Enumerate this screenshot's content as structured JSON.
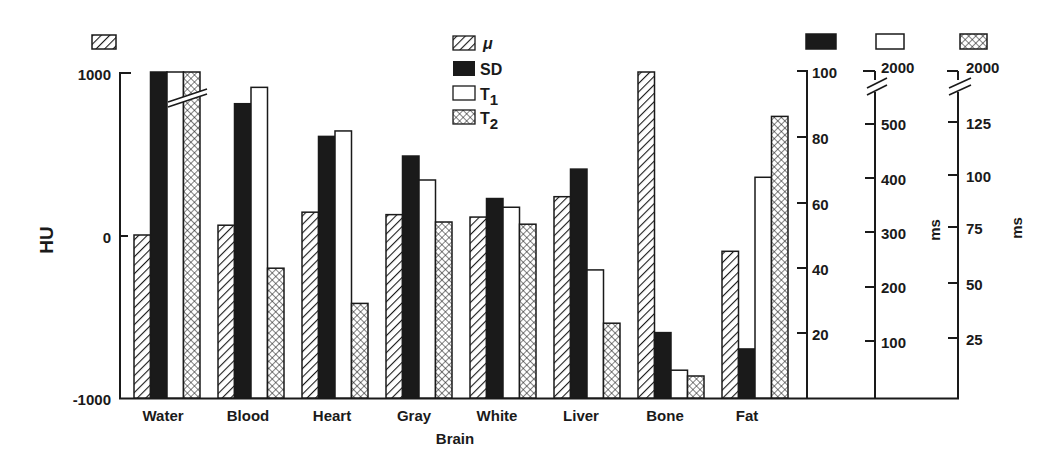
{
  "chart_data": {
    "type": "bar",
    "title": "",
    "xlabel": "",
    "categories": [
      "Water",
      "Blood",
      "Heart",
      "Gray\nBrain",
      "White",
      "Liver",
      "Bone",
      "Fat"
    ],
    "category_labels": [
      "Water",
      "Blood",
      "Heart",
      "Gray",
      "White",
      "Liver",
      "Bone",
      "Fat"
    ],
    "category_sublabel": {
      "index": 3.5,
      "text": "Brain"
    },
    "series": [
      {
        "name": "μ",
        "key": "mu",
        "pattern": "hatch",
        "axis": "HU",
        "values": [
          0,
          60,
          140,
          125,
          110,
          235,
          1000,
          -100
        ]
      },
      {
        "name": "SD",
        "key": "sd",
        "pattern": "solid-black",
        "axis": "SD",
        "values": [
          100,
          90,
          80,
          74,
          61,
          70,
          20,
          15
        ],
        "broken": [
          true,
          false,
          false,
          false,
          false,
          false,
          false,
          false
        ]
      },
      {
        "name": "T1",
        "key": "t1",
        "pattern": "white",
        "axis": "T1 ms",
        "values": [
          2000,
          570,
          490,
          400,
          350,
          235,
          51,
          405
        ],
        "broken": [
          true,
          false,
          false,
          false,
          false,
          false,
          false,
          false
        ]
      },
      {
        "name": "T2",
        "key": "t2",
        "pattern": "crosshatch",
        "axis": "T2 ms",
        "values": [
          2000,
          59,
          43,
          80,
          79,
          34,
          10,
          128
        ],
        "broken": [
          true,
          false,
          false,
          false,
          false,
          false,
          false,
          false
        ]
      }
    ],
    "axes": [
      {
        "id": "HU",
        "position": "left",
        "label": "HU",
        "range": [
          -1000,
          1000
        ],
        "ticks": [
          "1000",
          "0",
          "-1000"
        ],
        "legend_swatch": "hatch"
      },
      {
        "id": "SD",
        "position": "right-1",
        "label": "",
        "range": [
          0,
          100
        ],
        "ticks": [
          "100",
          "80",
          "60",
          "40",
          "20"
        ],
        "legend_swatch": "solid-black"
      },
      {
        "id": "T1",
        "position": "right-2",
        "label": "ms",
        "range": [
          0,
          550
        ],
        "ticks": [
          "2000",
          "500",
          "400",
          "300",
          "200",
          "100"
        ],
        "break_top": true,
        "legend_swatch": "white"
      },
      {
        "id": "T2",
        "position": "right-3",
        "label": "ms",
        "range": [
          0,
          137
        ],
        "ticks": [
          "2000",
          "125",
          "100",
          "75",
          "50",
          "25"
        ],
        "break_top": true,
        "legend_swatch": "crosshatch"
      }
    ],
    "legend": {
      "position": "top-center",
      "entries": [
        "μ",
        "SD",
        "T1",
        "T2"
      ]
    },
    "grid": false
  },
  "legend": {
    "mu": "μ",
    "sd": "SD",
    "t1_main": "T",
    "t1_sub": "1",
    "t2_main": "T",
    "t2_sub": "2"
  },
  "axis_labels": {
    "hu": "HU",
    "hu_ticks": [
      "1000",
      "0",
      "-1000"
    ],
    "sd_ticks": [
      "100",
      "80",
      "60",
      "40",
      "20"
    ],
    "t1_ticks": [
      "2000",
      "500",
      "400",
      "300",
      "200",
      "100"
    ],
    "t1_unit": "ms",
    "t2_ticks": [
      "2000",
      "125",
      "100",
      "75",
      "50",
      "25"
    ],
    "t2_unit": "ms"
  },
  "x_labels": [
    "Water",
    "Blood",
    "Heart",
    "Gray",
    "White",
    "Liver",
    "Bone",
    "Fat"
  ],
  "x_sublabel": "Brain"
}
